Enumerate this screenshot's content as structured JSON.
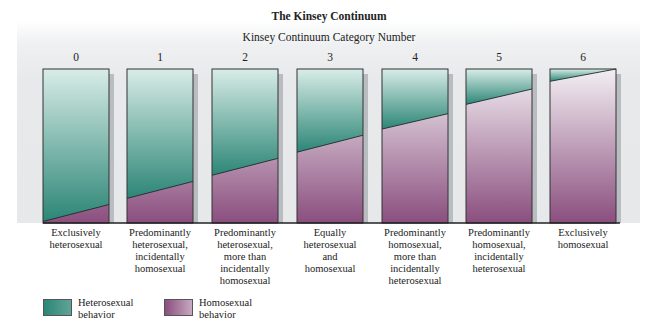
{
  "title": "The Kinsey Continuum",
  "subtitle": "Kinsey Continuum Category Number",
  "colors": {
    "heterosexual_top": "#d8ece7",
    "heterosexual_bottom": "#2c8676",
    "homosexual_top": "#f3eff3",
    "homosexual_bottom": "#8a4e7e",
    "background": "#e6e8ea"
  },
  "categories": [
    {
      "number": "0",
      "label_lines": [
        "Exclusively",
        "heterosexual"
      ]
    },
    {
      "number": "1",
      "label_lines": [
        "Predominantly",
        "heterosexual,",
        "incidentally",
        "homosexual"
      ]
    },
    {
      "number": "2",
      "label_lines": [
        "Predominantly",
        "heterosexual,",
        "more than",
        "incidentally",
        "homosexual"
      ]
    },
    {
      "number": "3",
      "label_lines": [
        "Equally",
        "heterosexual",
        "and",
        "homosexual"
      ]
    },
    {
      "number": "4",
      "label_lines": [
        "Predominantly",
        "homosexual,",
        "more than",
        "incidentally",
        "heterosexual"
      ]
    },
    {
      "number": "5",
      "label_lines": [
        "Predominantly",
        "homosexual,",
        "incidentally",
        "heterosexual"
      ]
    },
    {
      "number": "6",
      "label_lines": [
        "Exclusively",
        "homosexual"
      ]
    }
  ],
  "legend": [
    {
      "key": "heterosexual",
      "lines": [
        "Heterosexual",
        "behavior"
      ]
    },
    {
      "key": "homosexual",
      "lines": [
        "Homosexual",
        "behavior"
      ]
    }
  ],
  "chart_data": {
    "type": "bar",
    "title": "The Kinsey Continuum",
    "xlabel": "Kinsey Continuum Category Number",
    "ylabel": "",
    "categories": [
      "0",
      "1",
      "2",
      "3",
      "4",
      "5",
      "6"
    ],
    "category_labels": [
      "Exclusively heterosexual",
      "Predominantly heterosexual, incidentally homosexual",
      "Predominantly heterosexual, more than incidentally homosexual",
      "Equally heterosexual and homosexual",
      "Predominantly homosexual, more than incidentally heterosexual",
      "Predominantly homosexual, incidentally heterosexual",
      "Exclusively homosexual"
    ],
    "stacked": true,
    "ylim": [
      0,
      100
    ],
    "boundary_percent_from_bottom": {
      "left_edge": [
        1,
        16,
        31,
        46,
        61,
        77,
        92
      ],
      "right_edge": [
        12,
        27,
        42,
        57,
        71,
        87,
        100
      ]
    },
    "series": [
      {
        "name": "Heterosexual behavior",
        "values_mean_percent": [
          94,
          78,
          63,
          49,
          34,
          18,
          4
        ]
      },
      {
        "name": "Homosexual behavior",
        "values_mean_percent": [
          6,
          22,
          37,
          51,
          66,
          82,
          96
        ]
      }
    ],
    "legend_position": "bottom-left",
    "grid": false
  }
}
